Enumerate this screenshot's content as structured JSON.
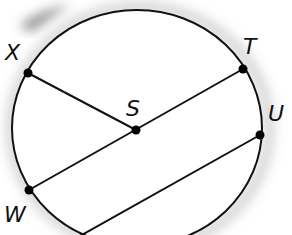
{
  "diagram": {
    "type": "circle-geometry",
    "circle": {
      "cx": 137,
      "cy": 128,
      "rx": 125,
      "ry": 118,
      "stroke": "#111111"
    },
    "points": [
      {
        "id": "X",
        "label": "X",
        "x": 28,
        "y": 73,
        "label_x": 5,
        "label_y": 42
      },
      {
        "id": "T",
        "label": "T",
        "x": 243,
        "y": 69,
        "label_x": 243,
        "label_y": 36
      },
      {
        "id": "S",
        "label": "S",
        "x": 136,
        "y": 130,
        "label_x": 126,
        "label_y": 98
      },
      {
        "id": "U",
        "label": "U",
        "x": 260,
        "y": 135,
        "label_x": 268,
        "label_y": 103
      },
      {
        "id": "W",
        "label": "W",
        "x": 29,
        "y": 190,
        "label_x": 4,
        "label_y": 204
      }
    ],
    "segments": [
      {
        "from": "X",
        "to": "S"
      },
      {
        "from": "W",
        "to": "T"
      },
      {
        "from": "U",
        "to": "bottom",
        "x2": 80,
        "y2": 236
      }
    ],
    "colors": {
      "line": "#111111",
      "point": "#000000",
      "shadow": "#bfbfbf"
    }
  }
}
